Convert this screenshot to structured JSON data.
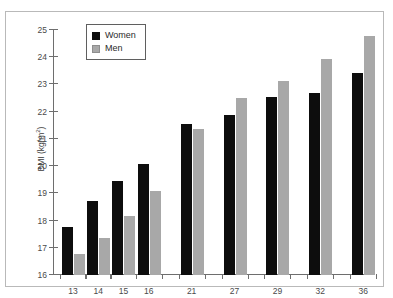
{
  "chart_data": {
    "type": "bar",
    "title": "",
    "subtitle": "",
    "xlabel": "",
    "ylabel": "BMI (kg/m2)",
    "ylabel_base": "BMI (kg/m",
    "ylabel_sup": "2",
    "ylabel_close": ")",
    "categories": [
      "13",
      "14",
      "15",
      "16",
      "21",
      "27",
      "29",
      "32",
      "36"
    ],
    "ylim": [
      16,
      25
    ],
    "yticks": [
      16,
      17,
      18,
      19,
      20,
      21,
      22,
      23,
      24,
      25
    ],
    "ytick_labels": [
      "16",
      "17",
      "18",
      "19",
      "20",
      "21",
      "22",
      "23",
      "24",
      "25"
    ],
    "grid": false,
    "legend_position": "top-center",
    "series": [
      {
        "name": "Women",
        "color": "#0d0d0d",
        "values": [
          17.78,
          18.73,
          19.47,
          20.07,
          21.54,
          21.88,
          22.54,
          22.7,
          23.41
        ]
      },
      {
        "name": "Men",
        "color": "#a8a8a8",
        "values": [
          16.77,
          17.35,
          18.16,
          19.07,
          21.38,
          22.52,
          23.12,
          23.95,
          24.79
        ]
      }
    ]
  },
  "legend": {
    "items": [
      {
        "label": "Women",
        "swatch": "black-square-icon"
      },
      {
        "label": "Men",
        "swatch": "gray-square-icon"
      }
    ]
  },
  "colors": {
    "women": "#0d0d0d",
    "men": "#a8a8a8",
    "axis": "#6e6e6e",
    "frame": "#b9b9b9",
    "background": "#ffffff"
  }
}
